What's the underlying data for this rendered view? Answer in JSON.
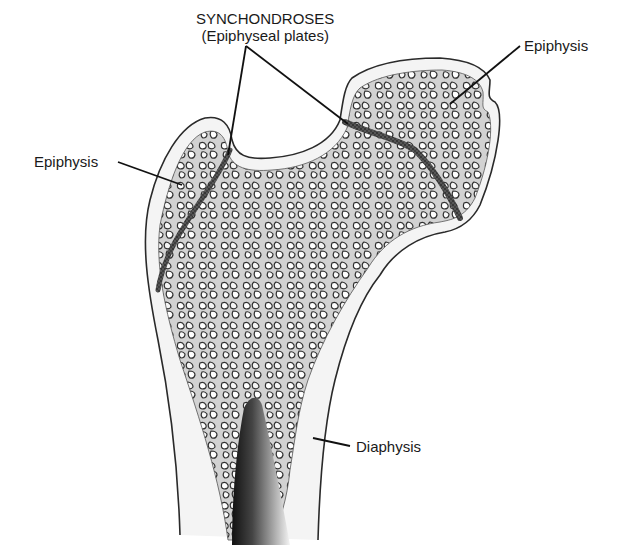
{
  "diagram": {
    "labels": {
      "synchondroses_title": "SYNCHONDROSES",
      "synchondroses_subtitle": "(Epiphyseal plates)",
      "epiphysis_left": "Epiphysis",
      "epiphysis_right": "Epiphysis",
      "diaphysis": "Diaphysis"
    },
    "colors": {
      "background": "#ffffff",
      "outline": "#2a2a2a",
      "spongy_fill": "#c8c8c8",
      "cortex_fill": "#f4f4f4",
      "plate": "#3a3a3a",
      "text": "#1a1a1a"
    }
  }
}
